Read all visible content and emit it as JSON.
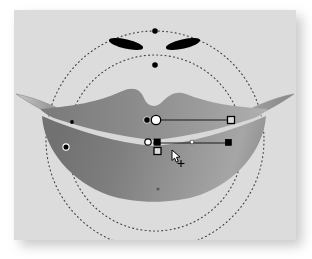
{
  "document": {
    "title": "Gradient mesh lips artwork",
    "canvas": {
      "x": 14,
      "y": 10,
      "width": 282,
      "height": 230,
      "background_color": "#dcdcdc",
      "shadow_color": "#b8b8b8"
    }
  },
  "palette": {
    "artboard_background": "#dcdcdc",
    "page_background": "#ffffff",
    "lip_dark": "#6d6d6d",
    "lip_mid": "#8e8e8e",
    "lip_light": "#a9a9a9",
    "lip_highlight": "#d2d2d2",
    "eye_fill": "#000000",
    "guide_stroke": "#4a4a4a",
    "handle_stroke": "#111111",
    "handle_fill_white": "#ffffff",
    "handle_fill_black": "#000000",
    "outline_stroke": "#7a7a7a"
  },
  "objects": [
    {
      "name": "eye-left",
      "type": "ellipse",
      "cx": 126,
      "cy": 44,
      "rx": 17,
      "ry": 4.6,
      "rotation_deg": 14,
      "fill": "#000000"
    },
    {
      "name": "eye-right",
      "type": "ellipse",
      "cx": 183,
      "cy": 44,
      "rx": 17,
      "ry": 4.6,
      "rotation_deg": -14,
      "fill": "#000000"
    },
    {
      "name": "upper-lip",
      "type": "path",
      "fill": "gradient-lip-upper"
    },
    {
      "name": "lower-lip",
      "type": "path",
      "fill": "gradient-lip-lower"
    },
    {
      "name": "lip-parting-highlight",
      "type": "path",
      "fill": "#d2d2d2"
    }
  ],
  "guides": [
    {
      "name": "outer-guide-circle",
      "type": "circle",
      "cx": 155,
      "cy": 140,
      "r": 109,
      "dash": "1 3"
    },
    {
      "name": "inner-guide-circle",
      "type": "circle",
      "cx": 155,
      "cy": 143,
      "r": 88,
      "dash": "1 3"
    }
  ],
  "anchors": [
    {
      "name": "anchor-outer-top",
      "x": 155,
      "y": 31,
      "shape": "dot",
      "fill": "#000000",
      "r": 2.6
    },
    {
      "name": "anchor-inner-top",
      "x": 155,
      "y": 65,
      "shape": "dot",
      "fill": "#000000",
      "r": 2.6
    },
    {
      "name": "anchor-outer-bottom",
      "x": 155,
      "y": 249,
      "shape": "dot",
      "fill": "#000000",
      "r": 2.2
    },
    {
      "name": "anchor-lip-left-upper",
      "x": 72,
      "y": 122,
      "shape": "dot",
      "fill": "#000000",
      "r": 1.8
    },
    {
      "name": "anchor-lip-left-lower",
      "x": 66,
      "y": 147,
      "shape": "ring",
      "fill": "#000000",
      "r": 3.0
    },
    {
      "name": "anchor-lip-bottom-mid",
      "x": 158,
      "y": 189,
      "shape": "dot",
      "fill": "#555555",
      "r": 1.6
    }
  ],
  "gradient_handles": [
    {
      "name": "gradient-handle-upper",
      "bar": {
        "x1": 153,
        "y1": 120,
        "x2": 230,
        "y2": 120
      },
      "origin": {
        "shape": "circle-filled",
        "x": 147,
        "y": 120,
        "r": 3.4,
        "fill": "#000000"
      },
      "node": {
        "shape": "circle-open",
        "x": 155,
        "y": 120,
        "r": 4.6,
        "fill": "#ffffff"
      },
      "end": {
        "shape": "square-open",
        "x": 230,
        "y": 120,
        "size": 6.5,
        "fill": "#dcdcdc"
      }
    },
    {
      "name": "gradient-handle-lower",
      "bar": {
        "x1": 152,
        "y1": 143,
        "x2": 228,
        "y2": 143
      },
      "origin": {
        "shape": "circle-open",
        "x": 148,
        "y": 142,
        "r": 3.2,
        "fill": "#ffffff"
      },
      "node": {
        "shape": "square-filled",
        "x": 157,
        "y": 142,
        "size": 6.0,
        "fill": "#000000"
      },
      "midpoint": {
        "shape": "dot-white",
        "x": 192,
        "y": 142,
        "r": 1.8,
        "fill": "#ffffff"
      },
      "end": {
        "shape": "square-filled",
        "x": 228,
        "y": 142,
        "size": 5.5,
        "fill": "#000000"
      },
      "drag": {
        "shape": "square-open",
        "x": 157,
        "y": 150,
        "size": 6.5,
        "fill": "#dcdcdc"
      }
    }
  ],
  "cursor": {
    "name": "gradient-tool-cursor",
    "x": 174,
    "y": 152,
    "label": "pointer-with-crosshair"
  }
}
